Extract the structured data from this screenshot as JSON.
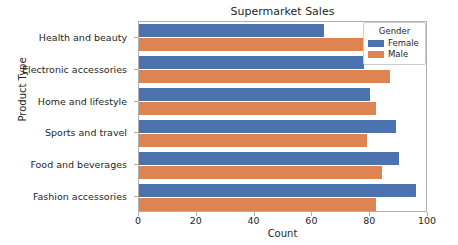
{
  "chart_data": {
    "type": "bar",
    "orientation": "horizontal",
    "title": "Supermarket Sales",
    "xlabel": "Count",
    "ylabel": "Product Type",
    "categories": [
      "Health and beauty",
      "Electronic accessories",
      "Home and lifestyle",
      "Sports and travel",
      "Food and beverages",
      "Fashion accessories"
    ],
    "series": [
      {
        "name": "Female",
        "color": "#4c72b0",
        "values": [
          64,
          78,
          80,
          89,
          90,
          96
        ]
      },
      {
        "name": "Male",
        "color": "#dd8452",
        "values": [
          78,
          87,
          82,
          79,
          84,
          82
        ]
      }
    ],
    "xlim": [
      0,
      100
    ],
    "xticks": [
      0,
      20,
      40,
      60,
      80,
      100
    ],
    "xtick_labels": [
      "0",
      "20",
      "40",
      "60",
      "80",
      "100"
    ],
    "grid": false,
    "legend": {
      "title": "Gender",
      "position": "upper right",
      "entries": [
        "Female",
        "Male"
      ]
    }
  }
}
